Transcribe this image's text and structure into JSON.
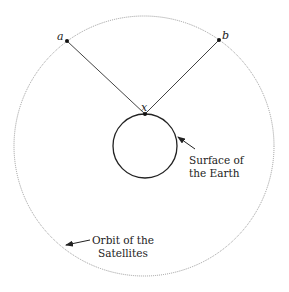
{
  "diagram": {
    "type": "geometry",
    "orbit": {
      "label_line1": "Orbit of the",
      "label_line2": "Satellites",
      "cx": 144,
      "cy": 146,
      "r": 130,
      "stroke": "#9a9a9a",
      "style": "dotted"
    },
    "earth": {
      "label_line1": "Surface of",
      "label_line2": "the Earth",
      "cx": 145,
      "cy": 146,
      "r": 32,
      "stroke": "#222222"
    },
    "points": {
      "a": {
        "label": "a",
        "x": 67,
        "y": 41
      },
      "b": {
        "label": "b",
        "x": 219,
        "y": 40
      },
      "x": {
        "label": "x",
        "x": 145,
        "y": 114
      }
    },
    "segments": [
      {
        "from": "a",
        "to": "x"
      },
      {
        "from": "b",
        "to": "x"
      }
    ],
    "line_color": "#444444"
  }
}
